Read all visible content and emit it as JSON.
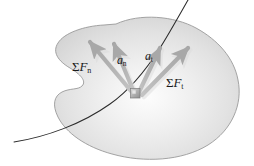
{
  "figure": {
    "background_color": "#ffffff",
    "body_fill_light": "#fefefe",
    "body_fill_mid": "#e4e4e4",
    "body_fill_dark": "#c9c9c9",
    "body_outline_color": "#9a9a9a",
    "path_curve_color": "#2b2b2b",
    "arrow_color": "#b2b2b2",
    "arrow_shadow_color": "#d8d8d8",
    "particle_fill": "#a8a8a8",
    "particle_highlight": "#d6d6d6",
    "label_color": "#1a1a1a"
  },
  "labels": {
    "sum_f_n": {
      "symbol": "ΣF",
      "sigma": "Σ",
      "base": "F",
      "subscript": "n",
      "meaning": "normal-component-resultant-force"
    },
    "sum_f_t": {
      "symbol": "ΣF",
      "sigma": "Σ",
      "base": "F",
      "subscript": "t",
      "meaning": "tangential-component-resultant-force"
    },
    "a_n": {
      "symbol": "a",
      "base": "a",
      "subscript": "n",
      "meaning": "normal-acceleration"
    },
    "a_t": {
      "symbol": "a",
      "base": "a",
      "subscript": "t",
      "meaning": "tangential-acceleration"
    }
  },
  "elements": {
    "body_region": "shaded-plane-region",
    "path_curve": "particle-trajectory-curve",
    "particle": "particle-block-marker",
    "vectors": [
      {
        "name": "sum-f-n-vector",
        "direction": "up-left"
      },
      {
        "name": "a-n-vector",
        "direction": "up-left"
      },
      {
        "name": "a-t-vector",
        "direction": "up-right"
      },
      {
        "name": "sum-f-t-vector",
        "direction": "up-right"
      }
    ]
  }
}
